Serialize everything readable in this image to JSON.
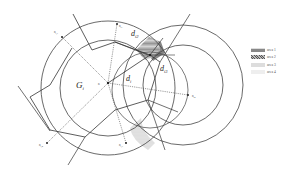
{
  "diagram": {
    "labels": {
      "cell": "G",
      "cell_sub": "i",
      "d_i": "d",
      "d_i_sub": "i",
      "d_i2": "d",
      "d_i2_sub": "i2",
      "d_i3": "d",
      "d_i3_sub": "i3",
      "center": "n",
      "node_top": "n",
      "node_top_sub": "i1",
      "node_left_top": "n",
      "node_left_top_sub": "i,1",
      "node_bottom_left": "n",
      "node_bottom_left_sub": "i,4",
      "node_bottom": "n",
      "node_bottom_sub": "i,3",
      "node_right": "n",
      "node_right_sub": "i2"
    }
  },
  "legend": {
    "items": [
      {
        "label": "area 1",
        "pattern": "horizontal-lines",
        "color": "#8a8a8a"
      },
      {
        "label": "area 2",
        "pattern": "crosshatch",
        "color": "#6a6a6a"
      },
      {
        "label": "area 3",
        "pattern": "dots",
        "color": "#a8a8a8"
      },
      {
        "label": "area 4",
        "pattern": "light-dots",
        "color": "#c8c8c8"
      }
    ]
  }
}
